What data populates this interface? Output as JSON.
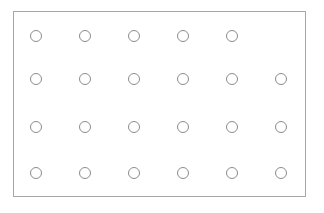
{
  "figure": {
    "title": "",
    "background_color": "#ffffff",
    "frame": {
      "name": "rectangular-border",
      "x": 13,
      "y": 11,
      "width": 293,
      "height": 186,
      "stroke_color": "#a6a6a6",
      "stroke_width": 1,
      "fill_color": "#ffffff"
    }
  },
  "grid": {
    "columns": 6,
    "rows": 4,
    "total_markers": 23,
    "marker": {
      "shape": "circle-outline",
      "diameter": 12,
      "stroke_color": "#8c8c8c",
      "stroke_width": 1,
      "fill_color": "none"
    },
    "column_centers_x": [
      36,
      85,
      134,
      183,
      232,
      281
    ],
    "row_centers_y": [
      36,
      79,
      127,
      173
    ],
    "column_spacing": 49,
    "row_spacing": [
      43,
      48,
      46
    ],
    "rows_detail": [
      {
        "index": 0,
        "label": "row-1",
        "marker_count": 5,
        "filled_columns": [
          1,
          2,
          3,
          4,
          5
        ],
        "empty_columns": [
          6
        ]
      },
      {
        "index": 1,
        "label": "row-2",
        "marker_count": 6,
        "filled_columns": [
          1,
          2,
          3,
          4,
          5,
          6
        ],
        "empty_columns": []
      },
      {
        "index": 2,
        "label": "row-3",
        "marker_count": 6,
        "filled_columns": [
          1,
          2,
          3,
          4,
          5,
          6
        ],
        "empty_columns": []
      },
      {
        "index": 3,
        "label": "row-4",
        "marker_count": 6,
        "filled_columns": [
          1,
          2,
          3,
          4,
          5,
          6
        ],
        "empty_columns": []
      }
    ]
  },
  "chart_data": {
    "type": "scatter",
    "title": "",
    "xlabel": "",
    "ylabel": "",
    "grid": false,
    "legend_position": "none",
    "xlim": [
      13,
      306
    ],
    "ylim": [
      11,
      197
    ],
    "x": [
      36,
      85,
      134,
      183,
      232,
      36,
      85,
      134,
      183,
      232,
      281,
      36,
      85,
      134,
      183,
      232,
      281,
      36,
      85,
      134,
      183,
      232,
      281
    ],
    "y": [
      36,
      36,
      36,
      36,
      36,
      79,
      79,
      79,
      79,
      79,
      79,
      127,
      127,
      127,
      127,
      127,
      127,
      173,
      173,
      173,
      173,
      173,
      173
    ],
    "marker_style": "open-circle",
    "marker_size": 12,
    "marker_color": "#8c8c8c",
    "point_count": 23
  }
}
